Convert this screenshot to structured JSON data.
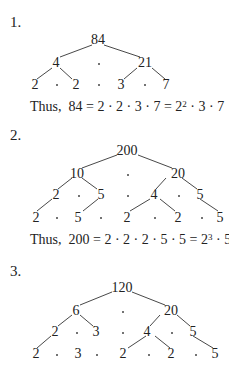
{
  "problems": [
    {
      "label": "1.",
      "root": "84",
      "level1": [
        "4",
        "21"
      ],
      "level2": [
        "2",
        "2",
        "3",
        "7"
      ],
      "conclusion": {
        "prefix": "Thus,",
        "lhs": "84",
        "product": "2 · 2 · 3 · 7",
        "power_base1": "2",
        "power_exp1": "2",
        "tail": "· 3 · 7"
      }
    },
    {
      "label": "2.",
      "root": "200",
      "level1": [
        "10",
        "20"
      ],
      "level2": [
        "2",
        "5",
        "4",
        "5"
      ],
      "level3": [
        "2",
        "5",
        "2",
        "2",
        "5"
      ],
      "conclusion": {
        "prefix": "Thus,",
        "lhs": "200",
        "product": "2 · 2 · 2 · 5 · 5",
        "power_base1": "2",
        "power_exp1": "3",
        "mid": "· 5",
        "power_exp2": "2"
      }
    },
    {
      "label": "3.",
      "root": "120",
      "level1": [
        "6",
        "20"
      ],
      "level2": [
        "2",
        "3",
        "4",
        "5"
      ],
      "level3": [
        "2",
        "3",
        "2",
        "2",
        "5"
      ]
    }
  ],
  "symbols": {
    "eq": "=",
    "dot": "·"
  }
}
